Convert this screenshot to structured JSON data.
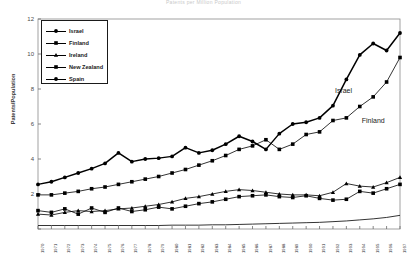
{
  "chart_data": {
    "type": "line",
    "title": "Patents per Million Population",
    "xlabel": "",
    "ylabel": "Patents/Population",
    "ylim": [
      0,
      12
    ],
    "yticks": [
      0,
      2,
      4,
      6,
      8,
      10,
      12
    ],
    "ytick_labels": [
      "",
      "2",
      "4",
      "6",
      "8",
      "10",
      "12"
    ],
    "grid": false,
    "legend_position": "upper-left",
    "x": [
      1970,
      1971,
      1972,
      1973,
      1974,
      1975,
      1976,
      1977,
      1978,
      1979,
      1980,
      1981,
      1982,
      1983,
      1984,
      1985,
      1986,
      1987,
      1988,
      1989,
      1990,
      1991,
      1992,
      1993,
      1994,
      1995,
      1996,
      1997
    ],
    "xtick_labels": [
      "1970",
      "1971",
      "1972",
      "1973",
      "1974",
      "1975",
      "1976",
      "1977",
      "1978",
      "1979",
      "1980",
      "1981",
      "1982",
      "1983",
      "1984",
      "1985",
      "1986",
      "1987",
      "1988",
      "1989",
      "1990",
      "1991",
      "1992",
      "1993",
      "1994",
      "1995",
      "1996",
      "1997"
    ],
    "series": [
      {
        "name": "Israel",
        "marker": "circle",
        "values": [
          2.55,
          2.7,
          2.95,
          3.2,
          3.45,
          3.75,
          4.35,
          3.85,
          4.0,
          4.05,
          4.15,
          4.65,
          4.35,
          4.5,
          4.85,
          5.3,
          5.0,
          4.55,
          5.45,
          6.0,
          6.1,
          6.35,
          7.05,
          8.55,
          9.95,
          10.6,
          10.2,
          11.2
        ]
      },
      {
        "name": "Finland",
        "marker": "square",
        "values": [
          1.95,
          1.95,
          2.05,
          2.15,
          2.3,
          2.4,
          2.55,
          2.7,
          2.85,
          3.0,
          3.2,
          3.4,
          3.65,
          3.9,
          4.2,
          4.55,
          4.75,
          5.1,
          4.55,
          4.85,
          5.4,
          5.55,
          6.2,
          6.35,
          7.0,
          7.55,
          8.4,
          9.8
        ]
      },
      {
        "name": "Ireland",
        "marker": "triangle",
        "values": [
          0.85,
          0.8,
          0.95,
          1.05,
          1.0,
          1.05,
          1.15,
          1.2,
          1.3,
          1.4,
          1.55,
          1.75,
          1.85,
          2.0,
          2.15,
          2.25,
          2.2,
          2.1,
          2.0,
          1.95,
          1.95,
          1.9,
          2.1,
          2.6,
          2.45,
          2.4,
          2.65,
          2.95
        ]
      },
      {
        "name": "New Zealand",
        "marker": "square",
        "values": [
          1.05,
          0.95,
          1.15,
          0.85,
          1.2,
          0.95,
          1.2,
          1.0,
          1.1,
          1.25,
          1.15,
          1.3,
          1.45,
          1.55,
          1.7,
          1.85,
          1.9,
          1.95,
          1.85,
          1.8,
          1.9,
          1.75,
          1.65,
          1.7,
          2.15,
          2.05,
          2.3,
          2.55
        ]
      },
      {
        "name": "Spain",
        "marker": "circle",
        "values": [
          0.2,
          0.2,
          0.2,
          0.2,
          0.2,
          0.2,
          0.2,
          0.2,
          0.2,
          0.2,
          0.22,
          0.22,
          0.22,
          0.24,
          0.24,
          0.26,
          0.28,
          0.3,
          0.32,
          0.34,
          0.36,
          0.38,
          0.42,
          0.46,
          0.52,
          0.58,
          0.66,
          0.78
        ]
      }
    ],
    "annotations": [
      {
        "text": "Israel",
        "x": 1992,
        "y": 7.9
      },
      {
        "text": "Finland",
        "x": 1994,
        "y": 6.2
      }
    ]
  },
  "legend": {
    "items": [
      {
        "label": "Israel"
      },
      {
        "label": "Finland"
      },
      {
        "label": "Ireland"
      },
      {
        "label": "New Zealand"
      },
      {
        "label": "Spain"
      }
    ]
  }
}
